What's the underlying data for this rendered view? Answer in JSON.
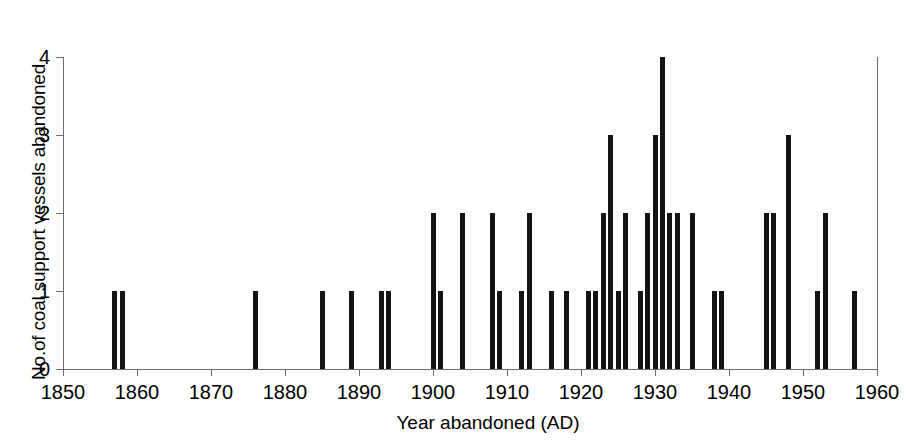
{
  "chart_data": {
    "type": "bar",
    "title": "",
    "xlabel": "Year abandoned (AD)",
    "ylabel": "No.of coal support vessels abandoned",
    "xlim": [
      1850,
      1960
    ],
    "ylim": [
      0,
      4
    ],
    "xticks": [
      1850,
      1860,
      1870,
      1880,
      1890,
      1900,
      1910,
      1920,
      1930,
      1940,
      1950,
      1960
    ],
    "yticks": [
      0,
      1,
      2,
      3,
      4
    ],
    "grid": false,
    "legend": null,
    "x": [
      1857,
      1858,
      1876,
      1885,
      1889,
      1893,
      1894,
      1900,
      1901,
      1904,
      1908,
      1909,
      1912,
      1913,
      1916,
      1918,
      1921,
      1922,
      1923,
      1924,
      1925,
      1926,
      1928,
      1929,
      1930,
      1931,
      1932,
      1933,
      1935,
      1938,
      1939,
      1945,
      1946,
      1948,
      1952,
      1953,
      1957
    ],
    "values": [
      1,
      1,
      1,
      1,
      1,
      1,
      1,
      2,
      1,
      2,
      2,
      1,
      1,
      2,
      1,
      1,
      1,
      1,
      2,
      3,
      1,
      2,
      1,
      2,
      3,
      4,
      2,
      2,
      2,
      1,
      1,
      2,
      2,
      3,
      1,
      2,
      1
    ],
    "bar_color": "#131313",
    "axis_color": "#6d6d6d"
  },
  "axis": {
    "x_title": "Year abandoned (AD)",
    "y_title": "No.of coal support vessels abandoned",
    "x_tick_labels": [
      "1850",
      "1860",
      "1870",
      "1880",
      "1890",
      "1900",
      "1910",
      "1920",
      "1930",
      "1940",
      "1950",
      "1960"
    ],
    "y_tick_labels": [
      "0",
      "1",
      "2",
      "3",
      "4"
    ]
  }
}
